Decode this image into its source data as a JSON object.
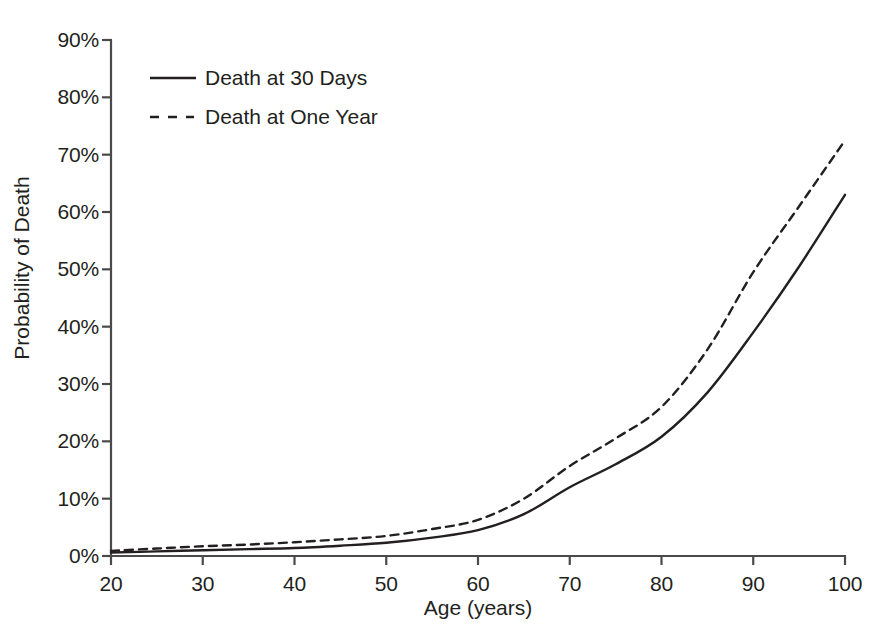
{
  "chart_data": {
    "type": "line",
    "title": "",
    "xlabel": "Age (years)",
    "ylabel": "Probability of Death",
    "xlim": [
      20,
      100
    ],
    "ylim": [
      0,
      90
    ],
    "xticks": [
      20,
      30,
      40,
      50,
      60,
      70,
      80,
      90,
      100
    ],
    "xtick_labels": [
      "20",
      "30",
      "40",
      "50",
      "60",
      "70",
      "80",
      "90",
      "100"
    ],
    "yticks": [
      0,
      10,
      20,
      30,
      40,
      50,
      60,
      70,
      80,
      90
    ],
    "ytick_labels": [
      "0%",
      "10%",
      "20%",
      "30%",
      "40%",
      "50%",
      "60%",
      "70%",
      "80%",
      "90%"
    ],
    "grid": false,
    "legend_position": "upper-left-inside",
    "x": [
      20,
      25,
      30,
      35,
      40,
      45,
      50,
      55,
      60,
      65,
      70,
      75,
      80,
      85,
      90,
      95,
      100
    ],
    "series": [
      {
        "name": "Death at 30 Days",
        "style": "solid",
        "color": "#231f20",
        "values": [
          0.6,
          0.8,
          1.0,
          1.2,
          1.4,
          1.8,
          2.3,
          3.2,
          4.5,
          7.3,
          12.0,
          16.0,
          20.8,
          28.5,
          39.0,
          50.5,
          63.0
        ]
      },
      {
        "name": "Death at One Year",
        "style": "dashed",
        "color": "#231f20",
        "values": [
          0.9,
          1.3,
          1.7,
          2.0,
          2.4,
          2.9,
          3.5,
          4.7,
          6.3,
          10.0,
          15.7,
          20.5,
          26.0,
          36.0,
          49.5,
          61.0,
          72.5
        ]
      }
    ]
  },
  "legend": {
    "entries": [
      {
        "label": "Death at 30 Days",
        "style": "solid"
      },
      {
        "label": "Death at One Year",
        "style": "dashed"
      }
    ]
  },
  "axes": {
    "x_label": "Age (years)",
    "y_label": "Probability of Death"
  },
  "colors": {
    "line": "#231f20",
    "axis": "#4a4a4a",
    "background": "#ffffff"
  }
}
